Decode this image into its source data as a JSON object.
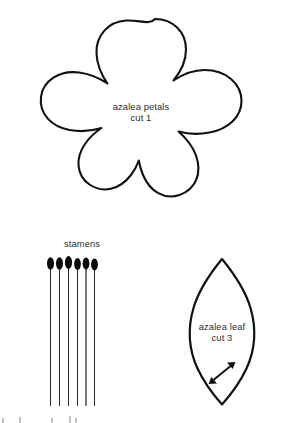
{
  "page": {
    "kind": "sewing-pattern-template-sheet",
    "background_color": "#ffffff",
    "ink_color": "#111111",
    "width": 282,
    "height": 423
  },
  "pieces": [
    {
      "id": "azalea-petals",
      "shape": "five-petal-flower",
      "label_line1": "azalea petals",
      "label_line2": "cut 1",
      "cut_quantity": "1"
    },
    {
      "id": "stamens",
      "shape": "six-pin-stamen-bundle",
      "label_line1": "stamens",
      "count": "6"
    },
    {
      "id": "azalea-leaf",
      "shape": "pointed-oval-leaf",
      "label_line1": "azalea leaf",
      "label_line2": "cut 3",
      "cut_quantity": "3",
      "grain_marker": "double-headed-arrow"
    }
  ],
  "petals": {
    "caption_line1": "azalea petals",
    "caption_line2": "cut 1"
  },
  "leaf": {
    "caption_line1": "azalea leaf",
    "caption_line2": "cut 3"
  },
  "stamens": {
    "caption_line1": "stamens"
  }
}
